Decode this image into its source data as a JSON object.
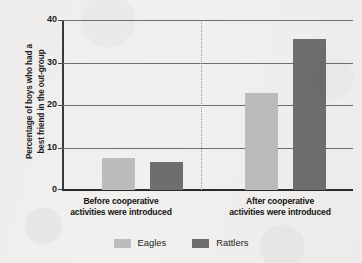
{
  "chart_data": {
    "type": "bar",
    "title": "",
    "subtitle": "",
    "xlabel": "",
    "ylabel": "Percentage of boys who had a\nbest friend in the out-group",
    "ylabel_lines": [
      "Percentage of boys who had a",
      "best friend in the out-group"
    ],
    "categories": [
      "Before cooperative\nactivities were introduced",
      "After cooperative\nactivities were introduced"
    ],
    "category_lines": [
      [
        "Before cooperative",
        "activities were introduced"
      ],
      [
        "After cooperative",
        "activities were introduced"
      ]
    ],
    "series": [
      {
        "name": "Eagles",
        "color": "#bcbcbc",
        "values": [
          7.5,
          22.8
        ]
      },
      {
        "name": "Rattlers",
        "color": "#6e6e6e",
        "values": [
          6.5,
          35.5
        ]
      }
    ],
    "ylim": [
      0,
      40
    ],
    "yticks": [
      0,
      10,
      20,
      30,
      40
    ],
    "ytick_labels": [
      "0",
      "10",
      "20",
      "30",
      "40"
    ],
    "grid": true,
    "grid_axis": "y",
    "legend_position": "bottom-center",
    "group_divider": true,
    "background_color": "#f1f0ee",
    "axis_color": "#2b2b2b",
    "grid_color": "#6f6f6f"
  },
  "legend": {
    "items": [
      {
        "label": "Eagles",
        "color": "#bcbcbc"
      },
      {
        "label": "Rattlers",
        "color": "#6e6e6e"
      }
    ]
  }
}
